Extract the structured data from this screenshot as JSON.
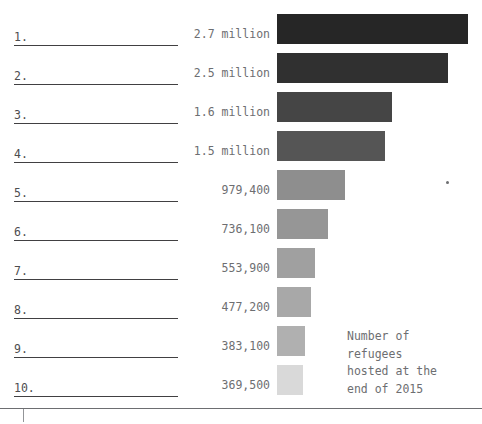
{
  "chart_data": {
    "type": "bar",
    "title": "",
    "xlabel": "",
    "ylabel": "",
    "legend": {
      "position": "inside-bottom-right",
      "lines": [
        "Number of",
        "refugees",
        "hosted at the",
        "end of 2015"
      ],
      "text": "Number of refugees hosted at the end of 2015"
    },
    "grid": false,
    "orientation": "horizontal",
    "xlim": [
      0,
      2900000
    ],
    "categories": [
      "1.",
      "2.",
      "3.",
      "4.",
      "5.",
      "6.",
      "7.",
      "8.",
      "9.",
      "10."
    ],
    "value_labels": [
      "2.7 million",
      "2.5 million",
      "1.6 million",
      "1.5 million",
      "979,400",
      "736,100",
      "553,900",
      "477,200",
      "383,100",
      "369,500"
    ],
    "values": [
      2700000,
      2500000,
      1600000,
      1500000,
      979400,
      736100,
      553900,
      477200,
      383100,
      369500
    ]
  },
  "rows": [
    {
      "rank": "1.",
      "value_label": "2.7 million",
      "bar_width": 191,
      "bar_color": "#262626",
      "top": 10
    },
    {
      "rank": "2.",
      "value_label": "2.5 million",
      "bar_width": 171,
      "bar_color": "#303030",
      "top": 49
    },
    {
      "rank": "3.",
      "value_label": "1.6 million",
      "bar_width": 115,
      "bar_color": "#454545",
      "top": 88
    },
    {
      "rank": "4.",
      "value_label": "1.5 million",
      "bar_width": 108,
      "bar_color": "#555555",
      "top": 127
    },
    {
      "rank": "5.",
      "value_label": "979,400",
      "bar_width": 68,
      "bar_color": "#8e8e8e",
      "top": 166
    },
    {
      "rank": "6.",
      "value_label": "736,100",
      "bar_width": 51,
      "bar_color": "#969696",
      "top": 205
    },
    {
      "rank": "7.",
      "value_label": "553,900",
      "bar_width": 38,
      "bar_color": "#a0a0a0",
      "top": 244
    },
    {
      "rank": "8.",
      "value_label": "477,200",
      "bar_width": 34,
      "bar_color": "#a8a8a8",
      "top": 283
    },
    {
      "rank": "9.",
      "value_label": "383,100",
      "bar_width": 28,
      "bar_color": "#b0b0b0",
      "top": 322
    },
    {
      "rank": "10.",
      "value_label": "369,500",
      "bar_width": 26,
      "bar_color": "#d9d9d9",
      "top": 361
    }
  ],
  "legend": {
    "line1": "Number of",
    "line2": "refugees",
    "line3": "hosted at the",
    "line4": "end of 2015"
  }
}
